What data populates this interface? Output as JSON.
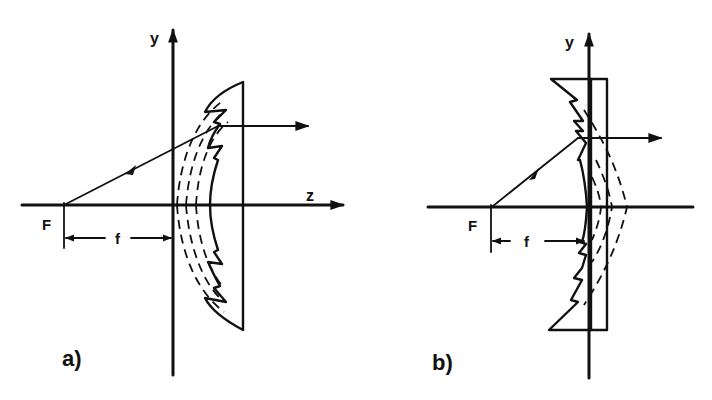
{
  "figure": {
    "panels": [
      {
        "id": "a",
        "label": "a)",
        "description": "Plano-convex Fresnel lens (collapsed convex surface) collimating rays from focal point F",
        "axis_y_label": "y",
        "axis_z_label": "z",
        "focal_point_label": "F",
        "focal_length_label": "f"
      },
      {
        "id": "b",
        "label": "b)",
        "description": "Flat Fresnel lens with sawtooth facets collimating rays from focal point F",
        "axis_y_label": "y",
        "focal_point_label": "F",
        "focal_length_label": "f"
      }
    ],
    "colors": {
      "ink": "#111111",
      "background": "#ffffff"
    }
  }
}
